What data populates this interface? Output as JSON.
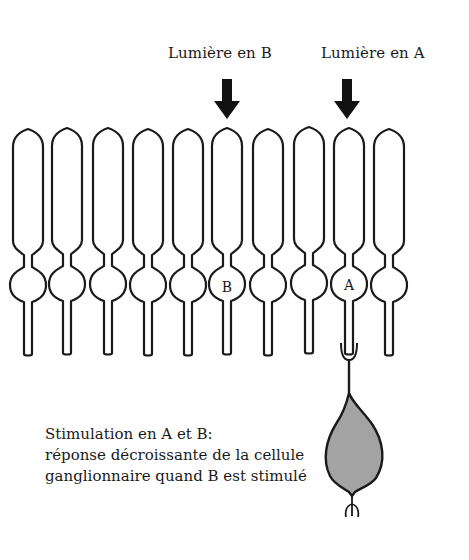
{
  "diagram": {
    "title_labels": {
      "light_b": "Lumière en B",
      "light_a": "Lumière en A"
    },
    "receptors": {
      "count": 10,
      "x_centers": [
        28,
        67,
        108,
        148,
        188,
        227,
        268,
        309,
        349,
        389
      ],
      "marked": [
        {
          "index": 5,
          "label": "B"
        },
        {
          "index": 8,
          "label": "A"
        }
      ]
    },
    "arrows": [
      {
        "target": "B",
        "x": 227
      },
      {
        "target": "A",
        "x": 347
      }
    ],
    "ganglion_cell": {
      "connected_to": "A",
      "fill_color": "#a3a3a3"
    },
    "caption": {
      "line1": "Stimulation en A et B:",
      "line2": "réponse décroissante de la cellule",
      "line3": "ganglionnaire quand B est stimulé"
    },
    "colors": {
      "ink": "#1a1a1a",
      "background": "#ffffff",
      "cell_fill": "#a3a3a3"
    }
  }
}
